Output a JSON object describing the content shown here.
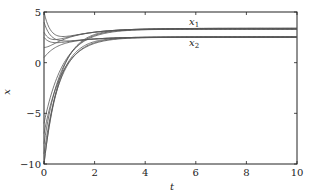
{
  "chart_data": {
    "type": "line",
    "title": "",
    "xlabel": "t",
    "ylabel": "x",
    "xlim": [
      0,
      10
    ],
    "ylim": [
      -10,
      5
    ],
    "xticks": [
      0,
      2,
      4,
      6,
      8,
      10
    ],
    "yticks": [
      -10,
      -5,
      0,
      5
    ],
    "grid": false,
    "legend": "inline annotations",
    "annotations": [
      {
        "text": "x1",
        "display": "x₁",
        "x": 5.9,
        "y": 3.9
      },
      {
        "text": "x2",
        "display": "x₂",
        "x": 5.9,
        "y": 1.7
      }
    ],
    "series": [
      {
        "name": "x1 (trajectories, upper group)",
        "x0_values": [
          5,
          4,
          3,
          2.5,
          1.5,
          0.5
        ],
        "steady_state": 3.3
      },
      {
        "name": "x2 (trajectories, lower group)",
        "x0_values": [
          -6,
          -7,
          -8,
          -9,
          -10,
          -10
        ],
        "steady_state": 2.5
      }
    ]
  },
  "axes": {
    "x_label": "t",
    "y_label": "x",
    "x_tick_labels": [
      "0",
      "2",
      "4",
      "6",
      "8",
      "10"
    ],
    "y_tick_labels": [
      "5",
      "0",
      "−5",
      "−10"
    ]
  },
  "labels": {
    "x1": "x",
    "x1_sub": "1",
    "x2": "x",
    "x2_sub": "2"
  },
  "colors": {
    "line": "#555555",
    "axis": "#222222"
  }
}
